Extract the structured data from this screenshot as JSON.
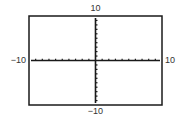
{
  "chart_data": {
    "type": "line",
    "title": "",
    "xlabel": "",
    "ylabel": "",
    "xlim": [
      -10,
      10
    ],
    "ylim": [
      -10,
      10
    ],
    "xscale": 1,
    "yscale": 1,
    "grid": false,
    "series": [],
    "tick_labels": {
      "xmin": "−10",
      "xmax": "10",
      "ymin": "−10",
      "ymax": "10"
    }
  }
}
